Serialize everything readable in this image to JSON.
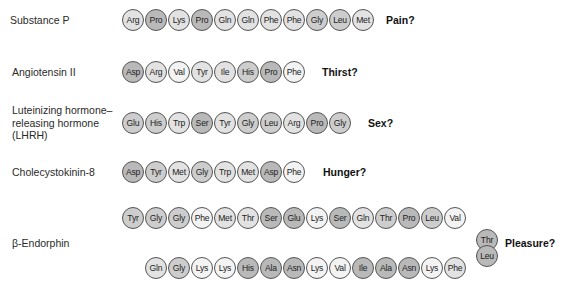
{
  "peptides": [
    {
      "name": "Substance P",
      "effect": "Pain?",
      "residues": [
        "Arg",
        "Pro",
        "Lys",
        "Pro",
        "Gln",
        "Gln",
        "Phe",
        "Phe",
        "Gly",
        "Leu",
        "Met"
      ],
      "shades": [
        1,
        3,
        1,
        3,
        1,
        1,
        1,
        1,
        2,
        2,
        1
      ]
    },
    {
      "name": "Angiotensin II",
      "effect": "Thirst?",
      "residues": [
        "Asp",
        "Arg",
        "Val",
        "Tyr",
        "Ile",
        "His",
        "Pro",
        "Phe"
      ],
      "shades": [
        3,
        1,
        0,
        1,
        1,
        2,
        3,
        0
      ]
    },
    {
      "name": "Luteinizing hormone– releasing hormone (LHRH)",
      "name_lines": [
        "Luteinizing hormone–",
        "releasing hormone",
        "(LHRH)"
      ],
      "effect": "Sex?",
      "residues": [
        "Glu",
        "His",
        "Trp",
        "Ser",
        "Tyr",
        "Gly",
        "Leu",
        "Arg",
        "Pro",
        "Gly"
      ],
      "shades": [
        2,
        2,
        1,
        3,
        1,
        2,
        2,
        1,
        3,
        2
      ]
    },
    {
      "name": "Cholecystokinin-8",
      "effect": "Hunger?",
      "residues": [
        "Asp",
        "Tyr",
        "Met",
        "Gly",
        "Trp",
        "Met",
        "Asp",
        "Phe"
      ],
      "shades": [
        3,
        2,
        1,
        2,
        1,
        1,
        3,
        0
      ]
    },
    {
      "name": "β-Endorphin",
      "effect": "Pleasure?",
      "residues_top": [
        "Tyr",
        "Gly",
        "Gly",
        "Phe",
        "Met",
        "Thr",
        "Ser",
        "Glu",
        "Lys",
        "Ser",
        "Gln",
        "Thr",
        "Pro",
        "Leu",
        "Val"
      ],
      "shades_top": [
        2,
        2,
        2,
        0,
        1,
        1,
        3,
        3,
        0,
        3,
        1,
        2,
        3,
        2,
        0
      ],
      "residues_turn": [
        "Thr",
        "Leu"
      ],
      "shades_turn": [
        3,
        3
      ],
      "residues_bottom": [
        "Gln",
        "Gly",
        "Lys",
        "Lys",
        "His",
        "Ala",
        "Asn",
        "Lys",
        "Val",
        "Ile",
        "Ala",
        "Asn",
        "Lys",
        "Phe"
      ],
      "shades_bottom": [
        1,
        2,
        0,
        0,
        3,
        3,
        3,
        0,
        0,
        3,
        3,
        3,
        0,
        1
      ]
    }
  ]
}
